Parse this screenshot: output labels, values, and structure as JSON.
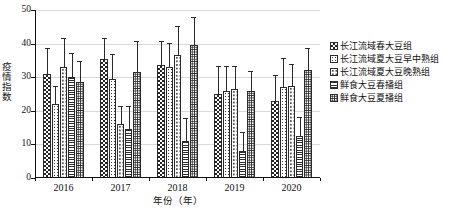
{
  "chart_data": {
    "type": "bar",
    "title": "",
    "xlabel": "年份（年）",
    "ylabel": "疫情指数",
    "categories": [
      "2016",
      "2017",
      "2018",
      "2019",
      "2020"
    ],
    "ylim": [
      0,
      50
    ],
    "yticks": [
      0,
      10,
      20,
      30,
      40,
      50
    ],
    "grid": true,
    "legend_position": "right",
    "error_bars": "upper only",
    "series": [
      {
        "name": "长江流域春大豆组",
        "pattern": "checkerboard",
        "values": [
          31.0,
          35.5,
          33.5,
          25.0,
          23.0
        ],
        "errors": [
          7.5,
          5.8,
          7.0,
          8.0,
          7.5
        ]
      },
      {
        "name": "长江流域夏大豆早中熟组",
        "pattern": "medium-dots",
        "values": [
          22.0,
          29.5,
          33.0,
          26.0,
          27.0
        ],
        "errors": [
          5.0,
          7.0,
          6.8,
          7.0,
          8.5
        ]
      },
      {
        "name": "长江流域夏大豆晚熟组",
        "pattern": "sparse-fine-dots",
        "values": [
          33.0,
          16.0,
          36.5,
          26.5,
          27.5
        ],
        "errors": [
          8.5,
          5.0,
          8.5,
          6.5,
          6.0
        ]
      },
      {
        "name": "鲜食大豆春播组",
        "pattern": "horizontal-lines",
        "values": [
          30.0,
          14.5,
          11.0,
          8.0,
          12.5
        ],
        "errors": [
          7.0,
          6.5,
          6.5,
          5.5,
          5.5
        ]
      },
      {
        "name": "鲜食大豆夏播组",
        "pattern": "dense-dots",
        "values": [
          28.5,
          31.5,
          39.5,
          26.0,
          32.0
        ],
        "errors": [
          6.0,
          9.0,
          8.0,
          5.5,
          6.5
        ]
      }
    ]
  },
  "axes": {
    "y_title": "疫情指数",
    "x_title": "年份（年）",
    "y_tick_labels": [
      "0",
      "10",
      "20",
      "30",
      "40",
      "50"
    ],
    "x_tick_labels": [
      "2016",
      "2017",
      "2018",
      "2019",
      "2020"
    ]
  },
  "legend": {
    "items": [
      {
        "label": "长江流域春大豆组"
      },
      {
        "label": "长江流域夏大豆早中熟组"
      },
      {
        "label": "长江流域夏大豆晚熟组"
      },
      {
        "label": "鲜食大豆春播组"
      },
      {
        "label": "鲜食大豆夏播组"
      }
    ]
  },
  "colors": {
    "axis": "#111111",
    "grid": "#d9d9d9",
    "bar_outline": "#2a2a2a",
    "background": "#ffffff"
  }
}
